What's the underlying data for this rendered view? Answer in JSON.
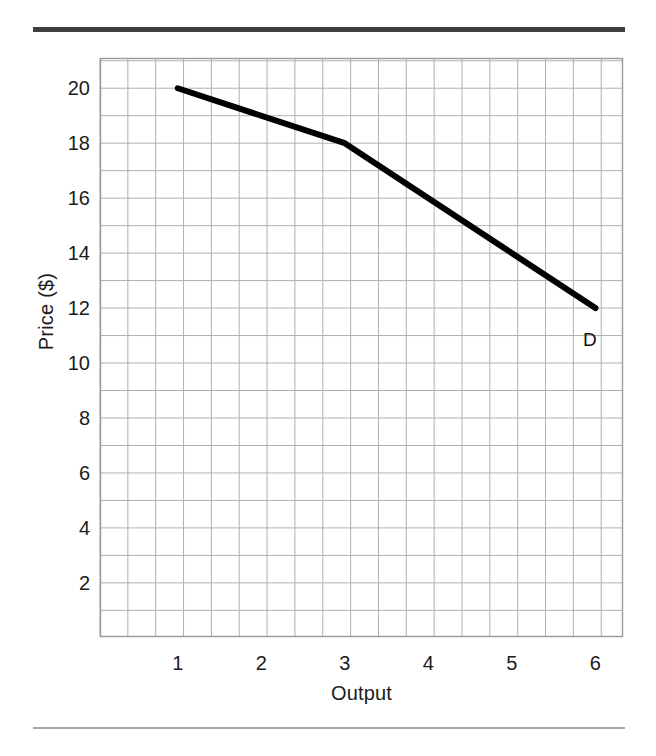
{
  "figure": {
    "background_color": "#ffffff",
    "rule_top_color": "#3e3e3e",
    "rule_bottom_color": "#a8a8a8"
  },
  "chart_data": {
    "type": "line",
    "title": "",
    "xlabel": "Output",
    "ylabel": "Price ($)",
    "x": [
      1,
      3,
      6
    ],
    "values": [
      20,
      18,
      12
    ],
    "series": [
      {
        "name": "D",
        "x": [
          1,
          3,
          6
        ],
        "values": [
          20,
          18,
          12
        ],
        "color": "#000000",
        "line_width": 6
      }
    ],
    "annotations": [
      {
        "text": "D",
        "x": 5.85,
        "y": 11.2
      }
    ],
    "xlim": [
      0.07,
      6.33
    ],
    "ylim": [
      0.03,
      21.1
    ],
    "xticks": [
      1,
      2,
      3,
      4,
      5,
      6
    ],
    "xticklabels": [
      "1",
      "2",
      "3",
      "4",
      "5",
      "6"
    ],
    "yticks": [
      2,
      4,
      6,
      8,
      10,
      12,
      14,
      16,
      18,
      20
    ],
    "yticklabels": [
      "2",
      "4",
      "6",
      "8",
      "10",
      "12",
      "14",
      "16",
      "18",
      "20"
    ],
    "grid": true,
    "grid_color": "#b0b0b0",
    "grid_minor_step_x": 0.3333,
    "grid_minor_step_y": 1,
    "legend": "none",
    "axes_border_color": "#9a9a9a"
  }
}
